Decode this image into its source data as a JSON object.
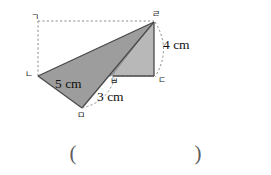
{
  "figure": {
    "colors": {
      "fill_dark": "#9d9d9d",
      "fill_light": "#b5b5b5",
      "outline": "#4a4a4a",
      "dashed": "#8c8c8c",
      "text": "#111111"
    },
    "vertex_labels": [
      {
        "id": "g",
        "text": "ㄱ",
        "x": 31,
        "y": 13
      },
      {
        "id": "r",
        "text": "ㄹ",
        "x": 154,
        "y": 11
      },
      {
        "id": "n",
        "text": "ㄴ",
        "x": 26,
        "y": 71
      },
      {
        "id": "d",
        "text": "ㄷ",
        "x": 159,
        "y": 76
      },
      {
        "id": "b",
        "text": "ㅂ",
        "x": 115,
        "y": 75
      },
      {
        "id": "m",
        "text": "ㅁ",
        "x": 77,
        "y": 112
      }
    ],
    "dimension_labels": [
      {
        "id": "side-5cm",
        "text": "5 cm",
        "x": 57,
        "y": 80
      },
      {
        "id": "side-3cm",
        "text": "3 cm",
        "x": 98,
        "y": 95
      },
      {
        "id": "side-4cm",
        "text": "4 cm",
        "x": 167,
        "y": 41
      }
    ],
    "geometry": {
      "point_g": [
        38,
        21
      ],
      "point_r": [
        154,
        22
      ],
      "point_n": [
        38,
        76
      ],
      "point_d": [
        154,
        76
      ],
      "point_b": [
        113,
        76
      ],
      "point_m": [
        82,
        108
      ]
    }
  },
  "answer_blank": {
    "open_paren": "(",
    "close_paren": ")"
  }
}
